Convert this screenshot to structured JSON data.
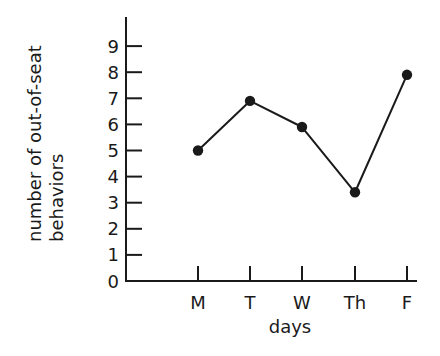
{
  "chart_data": {
    "type": "line",
    "title": "",
    "xlabel": "days",
    "ylabel": [
      "number of out-of-seat",
      "behaviors"
    ],
    "categories": [
      "M",
      "T",
      "W",
      "Th",
      "F"
    ],
    "series": [
      {
        "name": "out-of-seat behaviors",
        "values": [
          5,
          6.9,
          5.9,
          3.4,
          7.9
        ]
      }
    ],
    "yticks": [
      0,
      1,
      2,
      3,
      4,
      5,
      6,
      7,
      8,
      9
    ],
    "ylim": [
      0,
      9.9
    ],
    "grid": false,
    "legend": null,
    "markers": "filled-circle"
  },
  "colors": {
    "ink": "#1a1a1a",
    "background": "#ffffff"
  }
}
